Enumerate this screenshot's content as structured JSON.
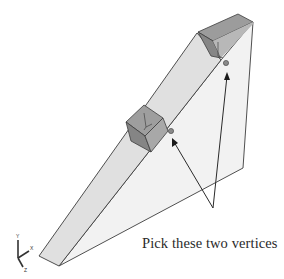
{
  "diagram": {
    "annotation": "Pick these two vertices",
    "triad_axes": [
      "Y",
      "X",
      "Z"
    ],
    "colors": {
      "ramp_face": "#e9e9e9",
      "ramp_strip": "#dcdcdc",
      "wall_face": "#f1f1f1",
      "block_top": "#9a9a9a",
      "block_front": "#888888",
      "block_side": "#a4a4a4",
      "edge": "#3c3c3c",
      "vertex_dot": "#8a8a8a",
      "arrow": "#2a2a2a"
    },
    "vertices": [
      {
        "name": "upper-vertex",
        "x": 226,
        "y": 63
      },
      {
        "name": "lower-vertex",
        "x": 171,
        "y": 131
      }
    ]
  }
}
